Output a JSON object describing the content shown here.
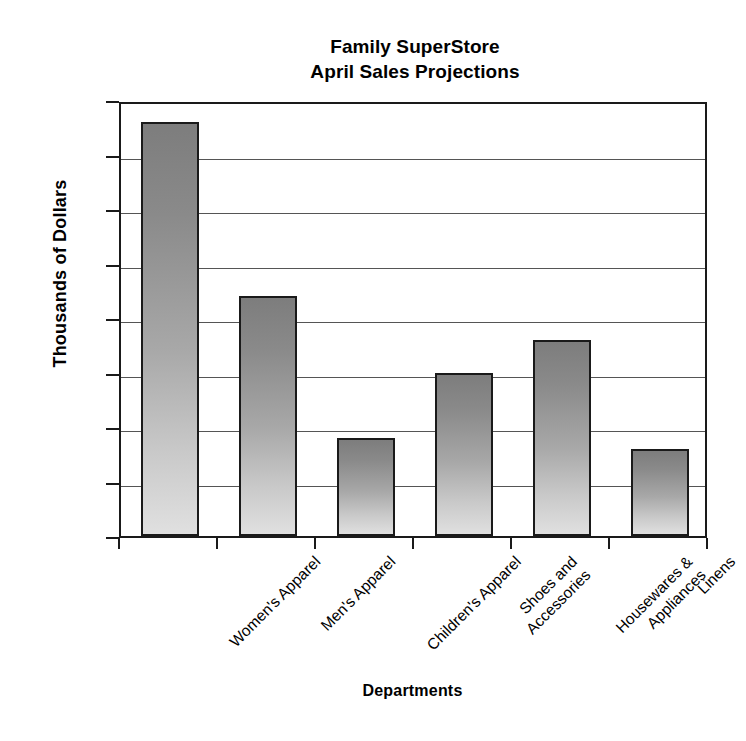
{
  "chart_data": {
    "type": "bar",
    "title": "Family SuperStore\nApril Sales Projections",
    "title_line1": "Family SuperStore",
    "title_line2": "April Sales Projections",
    "xlabel": "Departments",
    "ylabel": "Thousands of Dollars",
    "categories": [
      "Women's Apparel",
      "Men's Apparel",
      "Children's Apparel",
      "Shoes and Accessories",
      "Housewares & Appliances",
      "Linens"
    ],
    "category_lines": [
      [
        "Women's Apparel"
      ],
      [
        "Men's Apparel"
      ],
      [
        "Children's Apparel"
      ],
      [
        "Shoes and",
        "Accessories"
      ],
      [
        "Housewares &",
        "Appliances"
      ],
      [
        "Linens"
      ]
    ],
    "values": [
      38,
      22,
      9,
      15,
      18,
      8
    ],
    "ylim": [
      0,
      40
    ],
    "yticks": [
      0,
      5,
      10,
      15,
      20,
      25,
      30,
      35,
      40
    ],
    "ytick_labels": [
      "$0",
      "$5",
      "$10",
      "$15",
      "$20",
      "$25",
      "$30",
      "$35",
      "$40"
    ],
    "grid": true,
    "legend": false,
    "units": "thousands of dollars",
    "bar_fill_top": "#7d7d7d",
    "bar_fill_bottom": "#e0e0e0",
    "bar_edge_color": "#1a1a1a",
    "gridline_color": "#555555",
    "background": "#ffffff"
  }
}
